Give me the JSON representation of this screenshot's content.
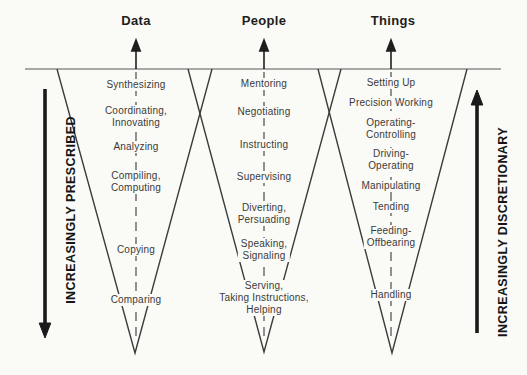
{
  "colors": {
    "background": "#fafaf6",
    "item_text": "#3a3a3a",
    "heading_text": "#1d1d1d",
    "baseline_gray": "#8c8c8c",
    "funnel_stroke": "#3c3c3c",
    "arrow_black": "#1a1a1a"
  },
  "left_axis": {
    "label": "INCREASINGLY PRESCRIBED",
    "direction": "down"
  },
  "right_axis": {
    "label": "INCREASINGLY DISCRETIONARY",
    "direction": "up"
  },
  "funnels": [
    {
      "name": "Data",
      "levels": [
        "Synthesizing",
        "Coordinating,\nInnovating",
        "Analyzing",
        "Compiling,\nComputing",
        "Copying",
        "Comparing"
      ]
    },
    {
      "name": "People",
      "levels": [
        "Mentoring",
        "Negotiating",
        "Instructing",
        "Supervising",
        "Diverting,\nPersuading",
        "Speaking,\nSignaling",
        "Serving,\nTaking Instructions,\nHelping"
      ]
    },
    {
      "name": "Things",
      "levels": [
        "Setting Up",
        "Precision Working",
        "Operating-\nControlling",
        "Driving-\nOperating",
        "Manipulating",
        "Tending",
        "Feeding-\nOffbearing",
        "Handling"
      ]
    }
  ]
}
